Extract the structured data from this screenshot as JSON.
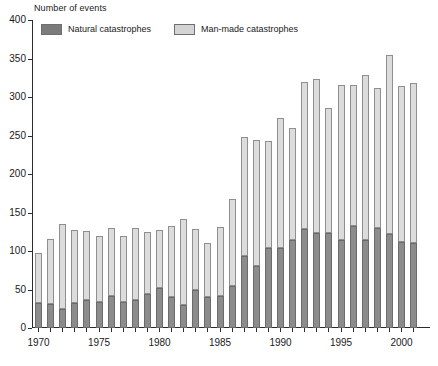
{
  "chart_data": {
    "type": "bar",
    "stacked": true,
    "title": "",
    "ylabel": "Number of events",
    "xlabel": "",
    "ylim": [
      0,
      400
    ],
    "ytick_step": 50,
    "yticks": [
      0,
      50,
      100,
      150,
      200,
      250,
      300,
      350,
      400
    ],
    "grid": false,
    "legend_position": "top-left-inside",
    "categories": [
      "1970",
      "1971",
      "1972",
      "1973",
      "1974",
      "1975",
      "1976",
      "1977",
      "1978",
      "1979",
      "1980",
      "1981",
      "1982",
      "1983",
      "1984",
      "1985",
      "1986",
      "1987",
      "1988",
      "1989",
      "1990",
      "1991",
      "1992",
      "1993",
      "1994",
      "1995",
      "1996",
      "1997",
      "1998",
      "1999",
      "2000",
      "2001"
    ],
    "xtick_labels": [
      "1970",
      "1975",
      "1980",
      "1985",
      "1990",
      "1995",
      "2000"
    ],
    "series": [
      {
        "name": "Natural catastrophes",
        "color": "#8c8c8c",
        "values": [
          32,
          31,
          25,
          32,
          36,
          34,
          42,
          34,
          37,
          44,
          52,
          40,
          30,
          50,
          40,
          42,
          55,
          94,
          80,
          104,
          104,
          114,
          128,
          124,
          124,
          114,
          132,
          114,
          130,
          122,
          112,
          110
        ]
      },
      {
        "name": "Man-made catastrophes",
        "color": "#dcdcdc",
        "values": [
          66,
          85,
          110,
          95,
          90,
          86,
          88,
          86,
          93,
          81,
          75,
          92,
          112,
          78,
          70,
          89,
          113,
          154,
          164,
          139,
          169,
          146,
          192,
          200,
          162,
          202,
          184,
          214,
          182,
          232,
          202,
          208
        ]
      }
    ],
    "totals": [
      98,
      116,
      135,
      127,
      126,
      120,
      130,
      120,
      130,
      125,
      127,
      132,
      142,
      128,
      110,
      131,
      168,
      248,
      244,
      243,
      273,
      260,
      320,
      324,
      286,
      316,
      316,
      328,
      312,
      354,
      314,
      318
    ]
  },
  "legend": {
    "items": [
      {
        "label": "Natural catastrophes",
        "key": "natural"
      },
      {
        "label": "Man-made catastrophes",
        "key": "manmade"
      }
    ]
  },
  "axis": {
    "y_title": "Number of events"
  }
}
